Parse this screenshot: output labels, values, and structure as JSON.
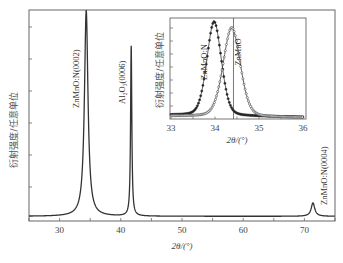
{
  "chart_data": [
    {
      "id": "main",
      "type": "line",
      "title": "",
      "xlabel": "2θ/(°)",
      "ylabel": "衍射强度/任意单位",
      "xlim": [
        25,
        75
      ],
      "ylim": [
        0,
        1
      ],
      "xticks": [
        30,
        40,
        50,
        60,
        70
      ],
      "xtick_labels": [
        "30",
        "40",
        "50",
        "60",
        "70"
      ],
      "ytick_count": 6,
      "ytick_labels": [],
      "grid": false,
      "series": [
        {
          "name": "XRD pattern",
          "color": "#333333",
          "peaks": [
            {
              "center": 34.35,
              "height": 1.15,
              "width": 0.35
            },
            {
              "center": 41.7,
              "height": 0.95,
              "width": 0.12
            },
            {
              "center": 71.4,
              "height": 0.075,
              "width": 0.35
            }
          ],
          "baseline": 0.015
        }
      ],
      "annotations": [
        {
          "text": "ZnMnO:N(0002)",
          "x": 34.35,
          "orientation": "vertical"
        },
        {
          "text": "Al₂O₃(0006)",
          "x": 41.7,
          "orientation": "vertical"
        },
        {
          "text": "ZnMnO:N(0004)",
          "x": 71.4,
          "orientation": "vertical"
        }
      ]
    },
    {
      "id": "inset",
      "type": "scatter",
      "title": "",
      "xlabel": "2θ/(°)",
      "ylabel": "衍射强度/任意单位",
      "xlim": [
        33,
        36
      ],
      "ylim": [
        0,
        1
      ],
      "xticks": [
        33,
        34,
        35,
        36
      ],
      "xtick_labels": [
        "33",
        "34",
        "35",
        "36"
      ],
      "grid": false,
      "reference_line_x": 34.42,
      "series": [
        {
          "name": "ZnMnO:N",
          "marker": "filled-circle",
          "center": 33.98,
          "height": 0.97,
          "width": 0.17,
          "baseline": 0.04
        },
        {
          "name": "ZnMnO",
          "marker": "open-circle",
          "center": 34.38,
          "height": 0.92,
          "width": 0.2,
          "baseline": 0.03
        }
      ],
      "annotations": [
        {
          "text": "ZnMnO:N",
          "x": 33.8,
          "orientation": "vertical"
        },
        {
          "text": "ZnMnO",
          "x": 34.55,
          "orientation": "vertical"
        }
      ]
    }
  ]
}
